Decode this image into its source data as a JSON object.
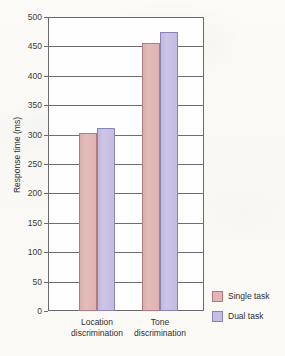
{
  "chart_data": {
    "type": "bar",
    "title": "",
    "xlabel": "",
    "ylabel": "Response time (ms)",
    "ylim": [
      0,
      500
    ],
    "ytick_step": 50,
    "yticks": [
      500,
      450,
      400,
      350,
      300,
      250,
      200,
      150,
      100,
      50,
      0
    ],
    "categories": [
      "Location discrimination",
      "Tone discrimination"
    ],
    "category_lines": [
      [
        "Location",
        "discrimination"
      ],
      [
        "Tone",
        "discrimination"
      ]
    ],
    "series": [
      {
        "name": "Single task",
        "values": [
          303,
          455
        ],
        "color": "#e0b5b4",
        "border": "#b4797c"
      },
      {
        "name": "Dual task",
        "values": [
          311,
          475
        ],
        "color": "#c6bde2",
        "border": "#8b82b8"
      }
    ],
    "grid": true,
    "grid_axis": "y",
    "legend_position": "bottom-right"
  },
  "legend": {
    "items": [
      {
        "label": "Single task"
      },
      {
        "label": "Dual task"
      }
    ]
  },
  "axis": {
    "y_title": "Response time (ms)"
  }
}
